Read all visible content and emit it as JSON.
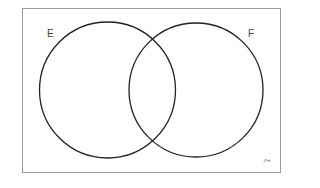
{
  "diagram": {
    "type": "venn",
    "universal_set_symbol": "ξ",
    "sets": [
      {
        "label": "E"
      },
      {
        "label": "F"
      }
    ],
    "colors": {
      "frame": "#9a9a9a",
      "circle_stroke": "#222222",
      "background": "#ffffff"
    }
  }
}
